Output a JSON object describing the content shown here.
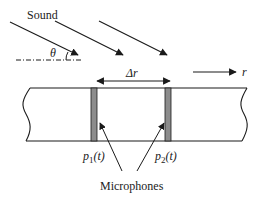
{
  "diagram": {
    "title_label": "Sound",
    "angle_label": "θ",
    "spacing_label": "Δr",
    "direction_label": "r",
    "mic1_label": {
      "p": "p",
      "sub": "1",
      "arg": "(t)"
    },
    "mic2_label": {
      "p": "p",
      "sub": "2",
      "arg": "(t)"
    },
    "microphones_label": "Microphones",
    "colors": {
      "line": "#1a1a1a",
      "microphone_fill": "#8c8c8c",
      "background": "#ffffff"
    }
  }
}
